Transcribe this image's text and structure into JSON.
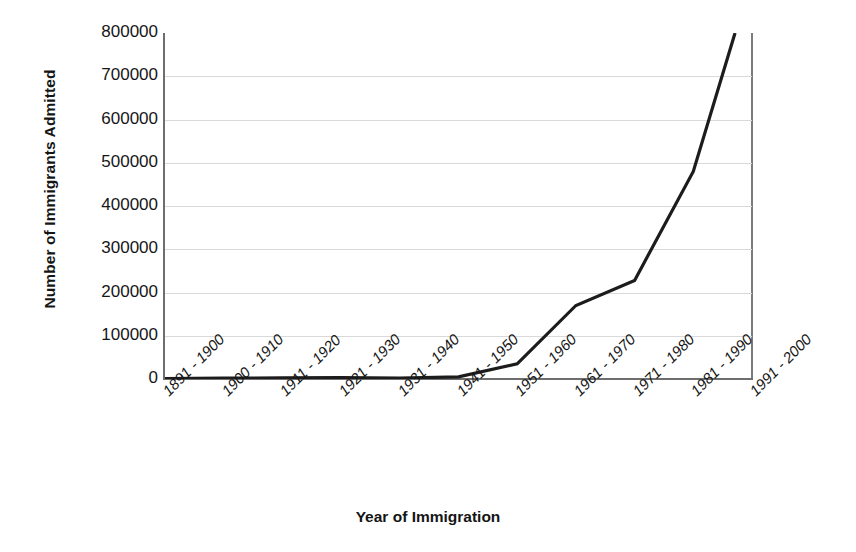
{
  "chart_data": {
    "type": "line",
    "title": "",
    "xlabel": "Year of Immigration",
    "ylabel": "Number of Immigrants Admitted",
    "categories": [
      "1891 - 1900",
      "1900 - 1910",
      "1911 - 1920",
      "1921 - 1930",
      "1931 - 1940",
      "1941 - 1950",
      "1951 - 1960",
      "1961 - 1970",
      "1971 - 1980",
      "1981 - 1990",
      "1991 - 2000"
    ],
    "values": [
      1000,
      2000,
      2500,
      3000,
      2000,
      5000,
      35000,
      170000,
      228000,
      480000,
      930000
    ],
    "ylim": [
      0,
      800000
    ],
    "ytick_labels": [
      "800000",
      "700000",
      "600000",
      "500000",
      "400000",
      "300000",
      "200000",
      "100000",
      "0"
    ],
    "ytick_values": [
      800000,
      700000,
      600000,
      500000,
      400000,
      300000,
      200000,
      100000,
      0
    ],
    "grid": true,
    "legend": "none",
    "line_color": "#1c1c1c",
    "gridline_color": "#d9d9d9",
    "axis_color": "#6e6e6e",
    "note": "Series exceeds the 800000 axis maximum in the final category and is clipped at the top of the plot area."
  }
}
